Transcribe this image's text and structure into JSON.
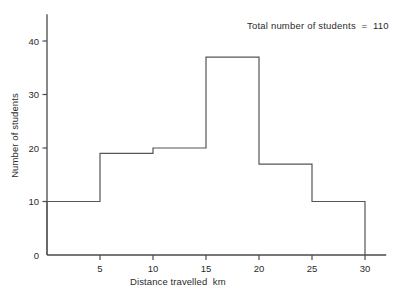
{
  "chart_data": {
    "type": "bar",
    "title": "",
    "subtitle": "",
    "xlabel": "Distance travelled  km",
    "ylabel": "Number of students",
    "annotation": "Total number of students  =  110",
    "grid": false,
    "legend": "none",
    "histogram": true,
    "bin_width": 5,
    "bin_edges": [
      0,
      5,
      10,
      15,
      20,
      25,
      30
    ],
    "categories": [
      "0-5",
      "5-10",
      "10-15",
      "15-20",
      "20-25",
      "25-30"
    ],
    "values": [
      10,
      19,
      20,
      37,
      17,
      10
    ],
    "xlim": [
      0,
      32
    ],
    "ylim": [
      0,
      45
    ],
    "xticks": [
      5,
      10,
      15,
      20,
      25,
      30
    ],
    "xtick_labels": [
      "5",
      "10",
      "15",
      "20",
      "25",
      "30"
    ],
    "yticks": [
      0,
      10,
      20,
      30,
      40
    ],
    "ytick_labels": [
      "0",
      "10",
      "20",
      "30",
      "40"
    ],
    "axis_color": "#4a4a4a",
    "bar_color": "#555555",
    "text_color": "#2b2b2b",
    "background": "#ffffff"
  }
}
